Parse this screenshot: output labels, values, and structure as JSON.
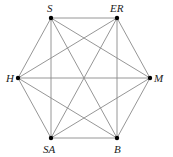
{
  "graph": {
    "type": "complete-graph-K6",
    "nodes": [
      {
        "id": "S",
        "label": "S",
        "x": 51,
        "y": 18,
        "lx": 47,
        "ly": 3
      },
      {
        "id": "ER",
        "label": "ER",
        "x": 117,
        "y": 18,
        "lx": 110,
        "ly": 3
      },
      {
        "id": "M",
        "label": "M",
        "x": 150,
        "y": 78,
        "lx": 154,
        "ly": 73
      },
      {
        "id": "B",
        "label": "B",
        "x": 117,
        "y": 138,
        "lx": 114,
        "ly": 144
      },
      {
        "id": "SA",
        "label": "SA",
        "x": 51,
        "y": 138,
        "lx": 43,
        "ly": 144
      },
      {
        "id": "H",
        "label": "H",
        "x": 18,
        "y": 78,
        "lx": 6,
        "ly": 73
      }
    ],
    "edge_color": "#8a8a8a",
    "node_color": "#000000"
  }
}
